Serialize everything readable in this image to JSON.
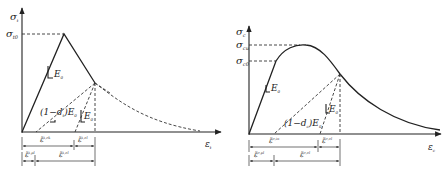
{
  "figure": {
    "panels": [
      {
        "id": "tension",
        "y_axis_label": "σ",
        "y_axis_sub": "t",
        "x_axis_label": "ε",
        "x_axis_sub": "t",
        "stress_levels": [
          {
            "label": "σ",
            "sub": "t0"
          }
        ],
        "modulus_label": "E",
        "modulus_sub": "0",
        "damaged_label_prefix": "(1−d",
        "damaged_label_sub": "t",
        "damaged_label_suffix": ")E",
        "damaged_label_sub2": "0",
        "unload_modulus_label": "E",
        "unload_modulus_sub": "0",
        "dim_row1": [
          {
            "label": "ε̃",
            "sup": "ck",
            "extra": "t"
          },
          {
            "label": "ε̃",
            "sup": "el",
            "extra": "t"
          }
        ],
        "dim_row2": [
          {
            "label": "ε̃",
            "sup": "pl",
            "extra": "t"
          },
          {
            "label": "ε̃",
            "sup": "el",
            "extra": "t"
          }
        ]
      },
      {
        "id": "compression",
        "y_axis_label": "σ",
        "y_axis_sub": "c",
        "x_axis_label": "ε",
        "x_axis_sub": "c",
        "stress_levels": [
          {
            "label": "σ",
            "sub": "cu"
          },
          {
            "label": "σ",
            "sub": "c0"
          }
        ],
        "modulus_label": "E",
        "modulus_sub": "0",
        "damaged_label_prefix": "(1−d",
        "damaged_label_sub": "c",
        "damaged_label_suffix": ")E",
        "damaged_label_sub2": "0",
        "unload_modulus_label": "E",
        "unload_modulus_sub": "0",
        "dim_row1": [
          {
            "label": "ε̃",
            "sup": "in",
            "extra": "c"
          },
          {
            "label": "ε̃",
            "sup": "el",
            "extra": "c"
          }
        ],
        "dim_row2": [
          {
            "label": "ε̃",
            "sup": "pl",
            "extra": "c"
          },
          {
            "label": "ε̃",
            "sup": "el",
            "extra": "c"
          }
        ]
      }
    ]
  }
}
